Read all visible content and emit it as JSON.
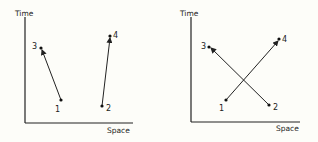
{
  "panels": [
    {
      "id": "left",
      "y_axis_label": "Time",
      "x_axis_label": "Space",
      "points": [
        {
          "label": "1",
          "x": 61,
          "y": 100,
          "lx": 55,
          "ly": 112
        },
        {
          "label": "2",
          "x": 102,
          "y": 106,
          "lx": 106,
          "ly": 111
        },
        {
          "label": "3",
          "x": 41,
          "y": 48,
          "lx": 32,
          "ly": 49
        },
        {
          "label": "4",
          "x": 110,
          "y": 36,
          "lx": 113,
          "ly": 38
        }
      ],
      "arrows": [
        {
          "from": "1",
          "to": "3"
        },
        {
          "from": "2",
          "to": "4"
        }
      ]
    },
    {
      "id": "right",
      "y_axis_label": "Time",
      "x_axis_label": "Space",
      "points": [
        {
          "label": "1",
          "x": 226,
          "y": 100,
          "lx": 219,
          "ly": 111
        },
        {
          "label": "2",
          "x": 269,
          "y": 105,
          "lx": 273,
          "ly": 110
        },
        {
          "label": "3",
          "x": 209,
          "y": 47,
          "lx": 201,
          "ly": 49
        },
        {
          "label": "4",
          "x": 279,
          "y": 39,
          "lx": 282,
          "ly": 42
        }
      ],
      "arrows": [
        {
          "from": "1",
          "to": "4"
        },
        {
          "from": "2",
          "to": "3"
        }
      ]
    }
  ],
  "labels": {
    "left_time": "Time",
    "left_space": "Space",
    "right_time": "Time",
    "right_space": "Space",
    "left_p1": "1",
    "left_p2": "2",
    "left_p3": "3",
    "left_p4": "4",
    "right_p1": "1",
    "right_p2": "2",
    "right_p3": "3",
    "right_p4": "4"
  }
}
